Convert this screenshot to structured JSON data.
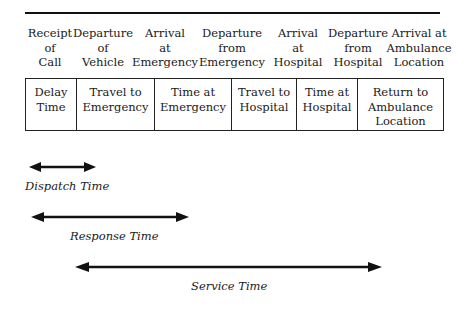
{
  "events": [
    {
      "label": "Receipt\nof\nCall"
    },
    {
      "label": "Departure\nof\nVehicle"
    },
    {
      "label": "Arrival\nat\nEmergency"
    },
    {
      "label": "Departure\nfrom\nEmergency"
    },
    {
      "label": "Arrival\nat\nHospital"
    },
    {
      "label": "Departure\nfrom\nHospital"
    },
    {
      "label": "Arrival at\nAmbulance\nLocation"
    }
  ],
  "intervals": [
    {
      "label": "Delay\nTime"
    },
    {
      "label": "Travel to\nEmergency"
    },
    {
      "label": "Time at\nEmergency"
    },
    {
      "label": "Travel to\nHospital"
    },
    {
      "label": "Time at\nHospital"
    },
    {
      "label": "Return to\nAmbulance\nLocation"
    }
  ],
  "spans": [
    {
      "label": "Dispatch Time"
    },
    {
      "label": "Response Time"
    },
    {
      "label": "Service Time"
    }
  ]
}
